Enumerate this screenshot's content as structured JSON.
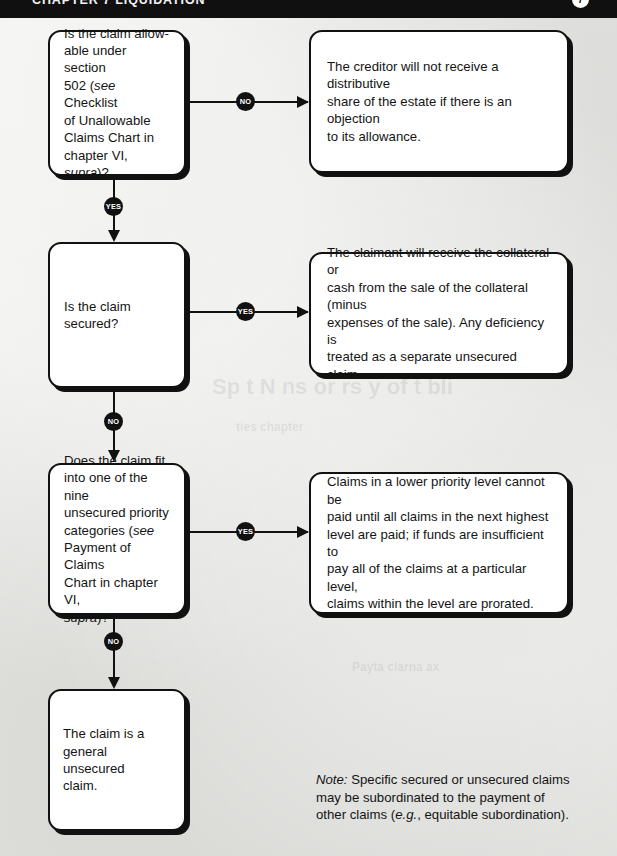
{
  "header": {
    "title": "CHAPTER 7 LIQUIDATION",
    "page_badge": "7"
  },
  "flowchart": {
    "type": "decision-flowchart",
    "nodes": [
      {
        "id": "q1",
        "kind": "decision",
        "text": "Is the claim allow-\nable under section\n502 (see Checklist\nof Unallowable\nClaims Chart in\nchapter VI, supra)?"
      },
      {
        "id": "a1",
        "kind": "outcome",
        "text": "The creditor will not receive a distributive\nshare of the estate if there is an objection\nto its allowance."
      },
      {
        "id": "q2",
        "kind": "decision",
        "text": "Is the claim\nsecured?"
      },
      {
        "id": "a2",
        "kind": "outcome",
        "text": "The claimant will receive the collateral or\ncash from the sale of the collateral (minus\nexpenses of the sale). Any deficiency is\ntreated as a separate unsecured claim."
      },
      {
        "id": "q3",
        "kind": "decision",
        "text": "Does the claim fit\ninto one of the nine\nunsecured priority\ncategories (see\nPayment of Claims\nChart in chapter VI,\nsupra)?"
      },
      {
        "id": "a3",
        "kind": "outcome",
        "text": "Claims in a lower priority level cannot be\npaid until all claims in the next highest\nlevel are paid; if funds are insufficient to\npay all of the claims at a particular level,\nclaims within the level are prorated."
      },
      {
        "id": "q4",
        "kind": "terminal",
        "text": "The claim is a\ngeneral unsecured\nclaim."
      }
    ],
    "edges": [
      {
        "id": "e1",
        "from": "q1",
        "to": "a1",
        "label": "NO",
        "direction": "right"
      },
      {
        "id": "e2",
        "from": "q1",
        "to": "q2",
        "label": "YES",
        "direction": "down"
      },
      {
        "id": "e3",
        "from": "q2",
        "to": "a2",
        "label": "YES",
        "direction": "right"
      },
      {
        "id": "e4",
        "from": "q2",
        "to": "q3",
        "label": "NO",
        "direction": "down"
      },
      {
        "id": "e5",
        "from": "q3",
        "to": "a3",
        "label": "YES",
        "direction": "right"
      },
      {
        "id": "e6",
        "from": "q3",
        "to": "q4",
        "label": "NO",
        "direction": "down"
      }
    ]
  },
  "note": {
    "label": "Note:",
    "text": " Specific secured or unsecured claims\nmay be subordinated to the payment of\nother claims (e.g., equitable subordination)."
  },
  "colors": {
    "ink": "#111111",
    "paper": "#e8e8e6",
    "node_fill": "#ffffff",
    "header_bar": "#101010",
    "badge_text": "#ffffff"
  }
}
